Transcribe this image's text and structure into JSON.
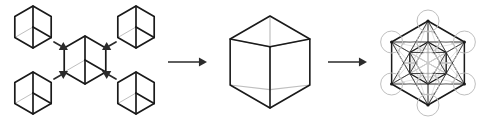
{
  "figure": {
    "background": "#ffffff",
    "width": 491,
    "height": 126,
    "stroke_dark": "#1a1a1a",
    "stroke_mid": "#444444",
    "stroke_light": "#bfbfbf",
    "stroke_faint": "#c9c9c9",
    "arrow_color": "#2b2b2b"
  },
  "panels": [
    {
      "id": "panel-1",
      "name": "four-cubes-converging",
      "caption": "",
      "cubes": [
        {
          "name": "cube-top-left",
          "cx": 33,
          "cy": 27,
          "r": 21,
          "style": "small"
        },
        {
          "name": "cube-top-right",
          "cx": 136,
          "cy": 27,
          "r": 21,
          "style": "small"
        },
        {
          "name": "cube-bottom-left",
          "cx": 33,
          "cy": 93,
          "r": 21,
          "style": "small"
        },
        {
          "name": "cube-bottom-right",
          "cx": 136,
          "cy": 93,
          "r": 21,
          "style": "small"
        },
        {
          "name": "cube-center",
          "cx": 85,
          "cy": 60,
          "r": 24,
          "style": "small"
        }
      ],
      "arrows": [
        {
          "name": "arrow-from-top-left",
          "x1": 54,
          "y1": 42,
          "x2": 68,
          "y2": 50
        },
        {
          "name": "arrow-from-top-right",
          "x1": 116,
          "y1": 42,
          "x2": 102,
          "y2": 50
        },
        {
          "name": "arrow-from-bottom-left",
          "x1": 54,
          "y1": 79,
          "x2": 68,
          "y2": 71
        },
        {
          "name": "arrow-from-bottom-right",
          "x1": 116,
          "y1": 79,
          "x2": 102,
          "y2": 71
        }
      ]
    },
    {
      "id": "panel-2",
      "name": "single-transparent-cube",
      "caption": "",
      "cube": {
        "name": "cube-large-wireframe",
        "cx": 270,
        "cy": 62,
        "r": 46,
        "style": "wireframe"
      }
    },
    {
      "id": "panel-3",
      "name": "metatrons-cube",
      "caption": "",
      "figure_center": {
        "cx": 428,
        "cy": 63
      },
      "outer_radius": 42,
      "inner_radius": 21,
      "node_circle_radius": 11,
      "node_count": 13,
      "description": "metatrons-cube-13-circles"
    }
  ],
  "connector_arrows": [
    {
      "name": "arrow-panel1-to-panel2",
      "x1": 168,
      "y1": 62,
      "x2": 207,
      "y2": 62
    },
    {
      "name": "arrow-panel2-to-panel3",
      "x1": 328,
      "y1": 62,
      "x2": 367,
      "y2": 62
    }
  ]
}
